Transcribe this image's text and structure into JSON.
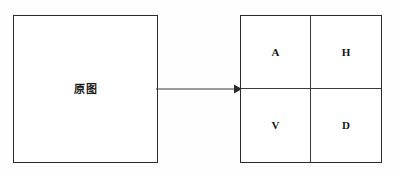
{
  "diagram": {
    "title": "",
    "colors": {
      "background": "#fefefe",
      "box_fill": "#ffffff",
      "box_border": "#2b2b2b",
      "divider": "#3a3a3a",
      "arrow": "#3a3a3a",
      "text": "#161616"
    },
    "source": {
      "label": "原图",
      "shape": "square"
    },
    "arrow": {
      "direction": "right",
      "style": "solid-line-with-filled-arrowhead",
      "label": ""
    },
    "decomposition": {
      "rows": 2,
      "columns": 2,
      "quadrants": [
        {
          "position": "top-left",
          "label": "A"
        },
        {
          "position": "top-right",
          "label": "H"
        },
        {
          "position": "bottom-left",
          "label": "V"
        },
        {
          "position": "bottom-right",
          "label": "D"
        }
      ]
    }
  }
}
